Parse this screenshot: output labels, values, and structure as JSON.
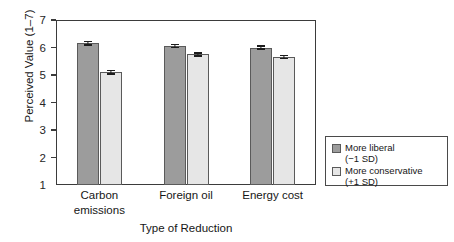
{
  "chart_data": {
    "type": "bar",
    "title": "",
    "xlabel": "Type of Reduction",
    "ylabel": "Perceived Value (1–7)",
    "ylim": [
      1,
      7
    ],
    "yticks": [
      1,
      2,
      3,
      4,
      5,
      6,
      7
    ],
    "ytick_labels": [
      "1",
      "2",
      "3",
      "4",
      "5",
      "6",
      "7"
    ],
    "grid": false,
    "legend_position": "right-bottom-outside",
    "categories": [
      "Carbon emissions",
      "Foreign oil",
      "Energy cost"
    ],
    "category_lines": [
      [
        "Carbon",
        "emissions"
      ],
      [
        "Foreign oil"
      ],
      [
        "Energy cost"
      ]
    ],
    "series": [
      {
        "name": "More liberal",
        "sublabel": "(−1 SD)",
        "color": "#9c9c9c",
        "values": [
          6.15,
          6.05,
          6.0
        ],
        "errors": [
          0.09,
          0.08,
          0.08
        ]
      },
      {
        "name": "More conservative",
        "sublabel": "(+1 SD)",
        "color": "#e6e6e6",
        "values": [
          5.1,
          5.75,
          5.65
        ],
        "errors": [
          0.09,
          0.08,
          0.08
        ]
      }
    ]
  },
  "legend": {
    "items": [
      {
        "label": "More liberal",
        "sublabel": "(−1 SD)"
      },
      {
        "label": "More conservative",
        "sublabel": "(+1 SD)"
      }
    ]
  },
  "axes": {
    "y_title": "Perceived Value (1–7)",
    "x_title": "Type of Reduction"
  }
}
